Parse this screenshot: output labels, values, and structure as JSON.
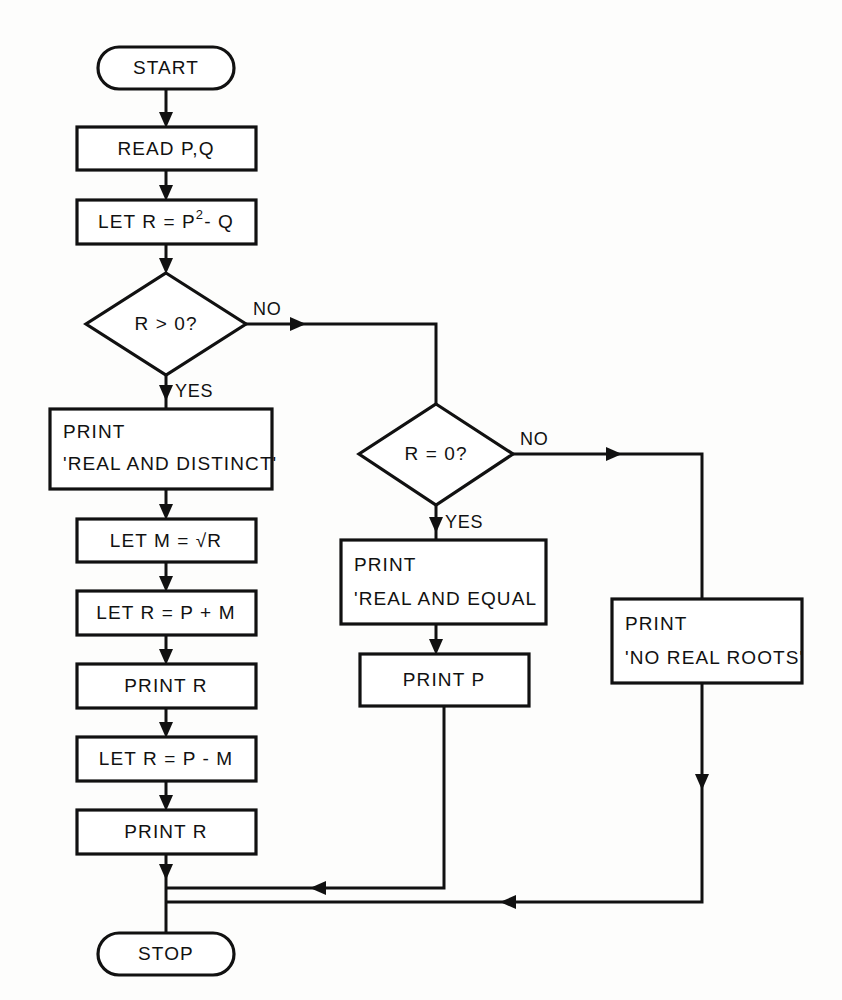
{
  "diagram": {
    "colors": {
      "ink": "#111111",
      "paper": "#fdfdfc",
      "shape_fill": "#ffffff"
    },
    "nodes": {
      "start": {
        "label": "START",
        "shape": "terminator"
      },
      "read": {
        "label": "READ P,Q",
        "shape": "process"
      },
      "let_r_disc": {
        "label_pre": "LET R = P",
        "label_sup": "2",
        "label_post": "- Q",
        "shape": "process"
      },
      "dec_gt": {
        "label": "R > 0?",
        "shape": "decision"
      },
      "print_distinct": {
        "line1": "PRINT",
        "line2": "'REAL AND DISTINCT'",
        "shape": "process"
      },
      "let_m": {
        "label": "LET  M = √R",
        "shape": "process"
      },
      "let_r_plus": {
        "label": "LET R = P + M",
        "shape": "process"
      },
      "print_r1": {
        "label": "PRINT  R",
        "shape": "process"
      },
      "let_r_minus": {
        "label": "LET R = P - M",
        "shape": "process"
      },
      "print_r2": {
        "label": "PRINT  R",
        "shape": "process"
      },
      "dec_eq": {
        "label": "R = 0?",
        "shape": "decision"
      },
      "print_equal": {
        "line1": "PRINT",
        "line2": "'REAL AND EQUAL",
        "shape": "process"
      },
      "print_p": {
        "label": "PRINT  P",
        "shape": "process"
      },
      "print_noroots": {
        "line1": "PRINT",
        "line2": "'NO REAL ROOTS'",
        "shape": "process"
      },
      "stop": {
        "label": "STOP",
        "shape": "terminator"
      }
    },
    "branch_labels": {
      "gt_no": "NO",
      "gt_yes": "YES",
      "eq_no": "NO",
      "eq_yes": "YES"
    }
  }
}
